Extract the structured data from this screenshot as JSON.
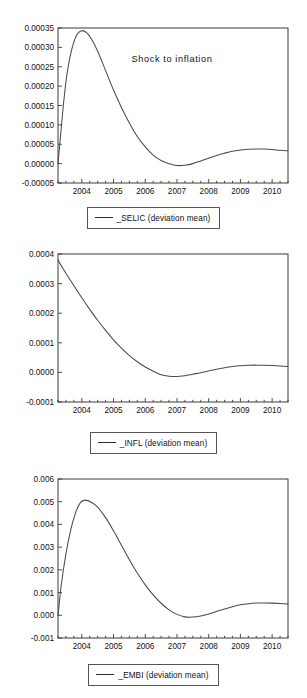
{
  "figure": {
    "title": "Shock to inflation",
    "panel_count": 3
  },
  "panels": [
    {
      "id": "selic",
      "title": "Shock to inflation",
      "legend": "_SELIC (deviation mean)",
      "yticks": [
        "0.00035",
        "0.00030",
        "0.00025",
        "0.00020",
        "0.00015",
        "0.00010",
        "0.00005",
        "0.00000",
        "-0.00005"
      ],
      "xticks": [
        "2004",
        "2005",
        "2006",
        "2007",
        "2008",
        "2009",
        "2010"
      ]
    },
    {
      "id": "infl",
      "title": "",
      "legend": "_INFL (deviation mean)",
      "yticks": [
        "0.0004",
        "0.0003",
        "0.0002",
        "0.0001",
        "0.0000",
        "-0.0001"
      ],
      "xticks": [
        "2004",
        "2005",
        "2006",
        "2007",
        "2008",
        "2009",
        "2010"
      ]
    },
    {
      "id": "embi",
      "title": "",
      "legend": "_EMBI (deviation mean)",
      "yticks": [
        "0.006",
        "0.005",
        "0.004",
        "0.003",
        "0.002",
        "0.001",
        "0.000",
        "-0.001"
      ],
      "xticks": [
        "2004",
        "2005",
        "2006",
        "2007",
        "2008",
        "2009",
        "2010"
      ]
    }
  ],
  "colors": {
    "curve": "#4a4a4a",
    "frame": "#3a3a3a",
    "text": "#111111",
    "background": "#ffffff"
  },
  "chart_data": [
    {
      "type": "line",
      "title": "Shock to inflation",
      "xlabel": "",
      "ylabel": "",
      "xlim": [
        2003.25,
        2010.5
      ],
      "ylim": [
        -5e-05,
        0.00035
      ],
      "grid": false,
      "legend_position": "below",
      "yticks": [
        0.00035,
        0.0003,
        0.00025,
        0.0002,
        0.00015,
        0.0001,
        5e-05,
        0.0,
        -5e-05
      ],
      "xticks": [
        2004,
        2005,
        2006,
        2007,
        2008,
        2009,
        2010
      ],
      "series": [
        {
          "name": "_SELIC (deviation mean)",
          "x": [
            2003.25,
            2003.35,
            2003.45,
            2003.55,
            2003.7,
            2003.85,
            2004.0,
            2004.15,
            2004.3,
            2004.5,
            2004.75,
            2005.0,
            2005.25,
            2005.5,
            2005.75,
            2006.0,
            2006.25,
            2006.5,
            2006.75,
            2007.0,
            2007.25,
            2007.5,
            2007.75,
            2008.0,
            2008.25,
            2008.5,
            2008.75,
            2009.0,
            2009.25,
            2009.5,
            2009.75,
            2010.0,
            2010.25,
            2010.5
          ],
          "y": [
            0.0,
            9e-05,
            0.000175,
            0.00024,
            0.0003,
            0.000333,
            0.000343,
            0.000338,
            0.000322,
            0.00029,
            0.00024,
            0.00019,
            0.000145,
            0.000105,
            7e-05,
            4.3e-05,
            2.2e-05,
            8e-06,
            0.0,
            -5e-06,
            -4e-06,
            0.0,
            7e-06,
            1.4e-05,
            2.1e-05,
            2.7e-05,
            3.2e-05,
            3.5e-05,
            3.72e-05,
            3.78e-05,
            3.75e-05,
            3.63e-05,
            3.45e-05,
            3.32e-05
          ]
        }
      ]
    },
    {
      "type": "line",
      "title": "",
      "xlabel": "",
      "ylabel": "",
      "xlim": [
        2003.25,
        2010.5
      ],
      "ylim": [
        -0.0001,
        0.0004
      ],
      "grid": false,
      "legend_position": "below",
      "yticks": [
        0.0004,
        0.0003,
        0.0002,
        0.0001,
        0.0,
        -0.0001
      ],
      "xticks": [
        2004,
        2005,
        2006,
        2007,
        2008,
        2009,
        2010
      ],
      "series": [
        {
          "name": "_INFL (deviation mean)",
          "x": [
            2003.25,
            2003.4,
            2003.6,
            2003.8,
            2004.0,
            2004.25,
            2004.5,
            2004.75,
            2005.0,
            2005.25,
            2005.5,
            2005.75,
            2006.0,
            2006.25,
            2006.5,
            2006.75,
            2007.0,
            2007.25,
            2007.5,
            2007.75,
            2008.0,
            2008.25,
            2008.5,
            2008.75,
            2009.0,
            2009.25,
            2009.5,
            2009.75,
            2010.0,
            2010.25,
            2010.5
          ],
          "y": [
            0.00038,
            0.000352,
            0.000318,
            0.000285,
            0.000252,
            0.000213,
            0.000176,
            0.000142,
            0.00011,
            8.2e-05,
            5.7e-05,
            3.6e-05,
            1.8e-05,
            4e-06,
            -8e-06,
            -1.3e-05,
            -1.4e-05,
            -1.1e-05,
            -6e-06,
            -1e-06,
            5e-06,
            1.1e-05,
            1.6e-05,
            2e-05,
            2.28e-05,
            2.42e-05,
            2.45e-05,
            2.4e-05,
            2.3e-05,
            2.15e-05,
            2e-05
          ]
        }
      ]
    },
    {
      "type": "line",
      "title": "",
      "xlabel": "",
      "ylabel": "",
      "xlim": [
        2003.25,
        2010.5
      ],
      "ylim": [
        -0.001,
        0.006
      ],
      "grid": false,
      "legend_position": "below",
      "yticks": [
        0.006,
        0.005,
        0.004,
        0.003,
        0.002,
        0.001,
        0.0,
        -0.001
      ],
      "xticks": [
        2004,
        2005,
        2006,
        2007,
        2008,
        2009,
        2010
      ],
      "series": [
        {
          "name": "_EMBI (deviation mean)",
          "x": [
            2003.25,
            2003.35,
            2003.5,
            2003.65,
            2003.8,
            2003.95,
            2004.1,
            2004.3,
            2004.5,
            2004.75,
            2005.0,
            2005.25,
            2005.5,
            2005.75,
            2006.0,
            2006.25,
            2006.5,
            2006.75,
            2007.0,
            2007.25,
            2007.5,
            2007.75,
            2008.0,
            2008.25,
            2008.5,
            2008.75,
            2009.0,
            2009.25,
            2009.5,
            2009.75,
            2010.0,
            2010.25,
            2010.5
          ],
          "y": [
            -3e-05,
            0.0013,
            0.0027,
            0.00375,
            0.0045,
            0.00495,
            0.00507,
            0.00498,
            0.00476,
            0.0043,
            0.00372,
            0.00308,
            0.00245,
            0.00186,
            0.00134,
            0.0009,
            0.00053,
            0.00024,
            4e-05,
            -7e-05,
            -8e-05,
            -3e-05,
            6e-05,
            0.00017,
            0.00028,
            0.00038,
            0.00046,
            0.00051,
            0.00054,
            0.000545,
            0.000535,
            0.000515,
            0.000498
          ]
        }
      ]
    }
  ]
}
